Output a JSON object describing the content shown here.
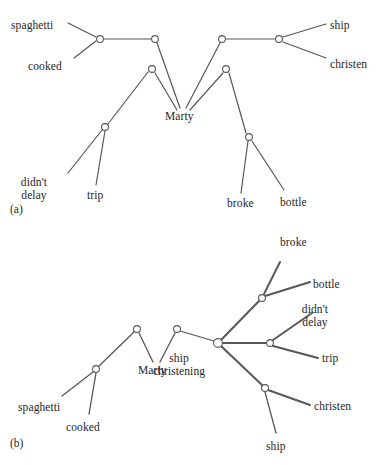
{
  "figure": {
    "stroke_color": "#57575c",
    "text_color": "#262628",
    "background": "#ffffff",
    "panels": [
      {
        "tag": "(a)",
        "tag_pos": {
          "x": 10,
          "y": 203
        },
        "labels": [
          {
            "name": "spaghetti",
            "text": "spaghetti",
            "x": 11,
            "y": 19,
            "align": "left"
          },
          {
            "name": "cooked",
            "text": "cooked",
            "x": 28,
            "y": 60,
            "align": "left"
          },
          {
            "name": "ship",
            "text": "ship",
            "x": 330,
            "y": 19,
            "align": "left"
          },
          {
            "name": "christen",
            "text": "christen",
            "x": 330,
            "y": 58,
            "align": "left"
          },
          {
            "name": "marty",
            "text": "Marty",
            "x": 165,
            "y": 110,
            "align": "left"
          },
          {
            "name": "didnt-delay",
            "text": "didn't\ndelay",
            "x": 34,
            "y": 176,
            "align": "center"
          },
          {
            "name": "trip",
            "text": "trip",
            "x": 87,
            "y": 189,
            "align": "left"
          },
          {
            "name": "broke",
            "text": "broke",
            "x": 227,
            "y": 197,
            "align": "left"
          },
          {
            "name": "bottle",
            "text": "bottle",
            "x": 280,
            "y": 196,
            "align": "left"
          }
        ],
        "nodes": [
          {
            "name": "node-a1",
            "x": 100,
            "y": 39
          },
          {
            "name": "node-a2",
            "x": 155,
            "y": 39
          },
          {
            "name": "node-a3",
            "x": 222,
            "y": 39
          },
          {
            "name": "node-a4",
            "x": 279,
            "y": 39
          },
          {
            "name": "node-a5",
            "x": 152,
            "y": 69
          },
          {
            "name": "node-a6",
            "x": 226,
            "y": 69
          },
          {
            "name": "node-a7",
            "x": 105,
            "y": 127
          },
          {
            "name": "node-a8",
            "x": 249,
            "y": 137
          }
        ],
        "edges": [
          {
            "name": "edge-spaghetti",
            "x1": 68,
            "y1": 23,
            "x2": 96,
            "y2": 37
          },
          {
            "name": "edge-cooked",
            "x1": 74,
            "y1": 58,
            "x2": 96,
            "y2": 41
          },
          {
            "name": "edge-a1-a2",
            "x1": 104,
            "y1": 39,
            "x2": 151,
            "y2": 39
          },
          {
            "name": "edge-a2-marty",
            "x1": 157,
            "y1": 43,
            "x2": 180,
            "y2": 108
          },
          {
            "name": "edge-a3-marty",
            "x1": 220,
            "y1": 43,
            "x2": 186,
            "y2": 108
          },
          {
            "name": "edge-a3-a4",
            "x1": 226,
            "y1": 39,
            "x2": 275,
            "y2": 39
          },
          {
            "name": "edge-ship",
            "x1": 283,
            "y1": 37,
            "x2": 326,
            "y2": 24
          },
          {
            "name": "edge-christen",
            "x1": 283,
            "y1": 42,
            "x2": 326,
            "y2": 58
          },
          {
            "name": "edge-a5-marty",
            "x1": 155,
            "y1": 73,
            "x2": 177,
            "y2": 110
          },
          {
            "name": "edge-a6-marty",
            "x1": 223,
            "y1": 73,
            "x2": 190,
            "y2": 110
          },
          {
            "name": "edge-a5-a7",
            "x1": 148,
            "y1": 72,
            "x2": 108,
            "y2": 124
          },
          {
            "name": "edge-a7-didnt",
            "x1": 102,
            "y1": 130,
            "x2": 68,
            "y2": 173
          },
          {
            "name": "edge-a7-trip",
            "x1": 105,
            "y1": 131,
            "x2": 96,
            "y2": 185
          },
          {
            "name": "edge-a6-a8",
            "x1": 229,
            "y1": 73,
            "x2": 246,
            "y2": 133
          },
          {
            "name": "edge-a8-broke",
            "x1": 248,
            "y1": 141,
            "x2": 241,
            "y2": 193
          },
          {
            "name": "edge-a8-bottle",
            "x1": 252,
            "y1": 141,
            "x2": 284,
            "y2": 190
          }
        ]
      },
      {
        "tag": "(b)",
        "tag_pos": {
          "x": 10,
          "y": 437
        },
        "labels": [
          {
            "name": "broke",
            "text": "broke",
            "x": 280,
            "y": 236,
            "align": "left"
          },
          {
            "name": "bottle",
            "text": "bottle",
            "x": 313,
            "y": 278,
            "align": "left"
          },
          {
            "name": "didnt-delay",
            "text": "didn't\ndelay",
            "x": 315,
            "y": 303,
            "align": "center"
          },
          {
            "name": "trip",
            "text": "trip",
            "x": 322,
            "y": 352,
            "align": "left"
          },
          {
            "name": "christen",
            "text": "christen",
            "x": 314,
            "y": 400,
            "align": "left"
          },
          {
            "name": "ship-bottom",
            "text": "ship",
            "x": 266,
            "y": 440,
            "align": "left"
          },
          {
            "name": "ship-christening",
            "text": "ship\nchristening",
            "x": 179,
            "y": 352,
            "align": "center"
          },
          {
            "name": "marty",
            "text": "Marty",
            "x": 138,
            "y": 364,
            "align": "left"
          },
          {
            "name": "spaghetti",
            "text": "spaghetti",
            "x": 18,
            "y": 401,
            "align": "left"
          },
          {
            "name": "cooked",
            "text": "cooked",
            "x": 66,
            "y": 421,
            "align": "left"
          }
        ],
        "nodes": [
          {
            "name": "node-b-root",
            "x": 218,
            "y": 343,
            "r": 4.4
          },
          {
            "name": "node-b-upper",
            "x": 262,
            "y": 298
          },
          {
            "name": "node-b-right",
            "x": 270,
            "y": 343
          },
          {
            "name": "node-b-lower",
            "x": 265,
            "y": 388
          },
          {
            "name": "node-b-peak2",
            "x": 177,
            "y": 329
          },
          {
            "name": "node-b-peak1",
            "x": 137,
            "y": 329
          },
          {
            "name": "node-b-left",
            "x": 96,
            "y": 369
          }
        ],
        "edges": [
          {
            "name": "edge-b-root-upper",
            "x1": 221,
            "y1": 340,
            "x2": 259,
            "y2": 301,
            "w": 2
          },
          {
            "name": "edge-b-upper-broke",
            "x1": 264,
            "y1": 294,
            "x2": 280,
            "y2": 262,
            "w": 2
          },
          {
            "name": "edge-b-upper-bottle",
            "x1": 265,
            "y1": 296,
            "x2": 310,
            "y2": 282,
            "w": 2
          },
          {
            "name": "edge-b-root-right",
            "x1": 222,
            "y1": 343,
            "x2": 266,
            "y2": 343,
            "w": 2
          },
          {
            "name": "edge-b-right-didnt",
            "x1": 273,
            "y1": 340,
            "x2": 312,
            "y2": 313,
            "w": 2
          },
          {
            "name": "edge-b-right-trip",
            "x1": 273,
            "y1": 346,
            "x2": 318,
            "y2": 358,
            "w": 2
          },
          {
            "name": "edge-b-root-lower",
            "x1": 221,
            "y1": 346,
            "x2": 262,
            "y2": 385,
            "w": 2
          },
          {
            "name": "edge-b-lower-christen",
            "x1": 268,
            "y1": 390,
            "x2": 310,
            "y2": 405,
            "w": 2
          },
          {
            "name": "edge-b-lower-ship",
            "x1": 265,
            "y1": 392,
            "x2": 276,
            "y2": 433,
            "w": 1.3
          },
          {
            "name": "edge-b-peak2-root",
            "x1": 180,
            "y1": 331,
            "x2": 214,
            "y2": 341,
            "w": 1.3
          },
          {
            "name": "edge-b-peak2-marty",
            "x1": 175,
            "y1": 333,
            "x2": 160,
            "y2": 362,
            "w": 1.3
          },
          {
            "name": "edge-b-peak1-marty",
            "x1": 139,
            "y1": 333,
            "x2": 153,
            "y2": 362,
            "w": 1.3
          },
          {
            "name": "edge-b-peak1-left",
            "x1": 134,
            "y1": 332,
            "x2": 99,
            "y2": 366,
            "w": 1.3
          },
          {
            "name": "edge-b-left-spaghetti",
            "x1": 93,
            "y1": 372,
            "x2": 62,
            "y2": 396,
            "w": 1.3
          },
          {
            "name": "edge-b-left-cooked",
            "x1": 96,
            "y1": 373,
            "x2": 89,
            "y2": 414,
            "w": 1.3
          }
        ]
      }
    ]
  }
}
